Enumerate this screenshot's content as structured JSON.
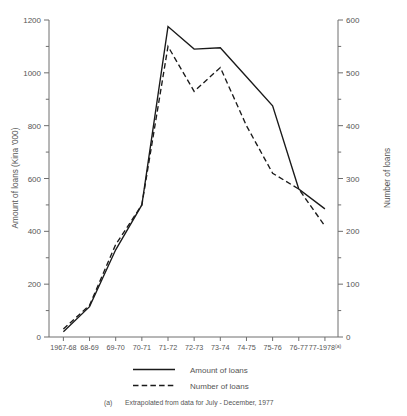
{
  "chart_data": {
    "type": "line",
    "title": "",
    "categories": [
      "1967-68",
      "68-69",
      "69-70",
      "70-71",
      "71-72",
      "72-73",
      "73-74",
      "74-75",
      "75-76",
      "76-77",
      "77-1978(a)"
    ],
    "xlabel": "",
    "ylabel": "Amount of loans (Kina '000)",
    "y2label": "Number of loans",
    "ylim": [
      0,
      1200
    ],
    "y2lim": [
      0,
      600
    ],
    "yticks": [
      0,
      200,
      400,
      600,
      800,
      1000,
      1200
    ],
    "ytick_labels": [
      "0",
      "200",
      "400",
      "600",
      "800",
      "1000",
      "1200"
    ],
    "y_minor_ticks": [
      100,
      300,
      500,
      700,
      900,
      1100
    ],
    "y2ticks": [
      0,
      100,
      200,
      300,
      400,
      500,
      600
    ],
    "y2tick_labels": [
      "0",
      "100",
      "200",
      "300",
      "400",
      "500",
      "600"
    ],
    "y2_minor_ticks": [
      50,
      150,
      250,
      350,
      450,
      550
    ],
    "grid": false,
    "legend_position": "below",
    "series": [
      {
        "name": "Amount of loans",
        "axis": "left",
        "style": "solid",
        "values": [
          20,
          115,
          330,
          500,
          1175,
          1090,
          1095,
          985,
          875,
          560,
          485
        ]
      },
      {
        "name": "Number of loans",
        "axis": "right",
        "style": "dashed",
        "values": [
          15,
          60,
          175,
          250,
          550,
          465,
          510,
          400,
          310,
          280,
          210
        ]
      }
    ],
    "annotations": [
      "(a)  Extrapolated from data for July - December, 1977"
    ]
  },
  "legend": {
    "items": [
      {
        "label": "Amount of loans",
        "style": "solid"
      },
      {
        "label": "Number of loans",
        "style": "dashed"
      }
    ]
  },
  "footnote": {
    "marker": "(a)",
    "text": "Extrapolated from data for July - December, 1977"
  },
  "axes": {
    "left_title": "Amount of loans (Kina '000)",
    "right_title": "Number of loans"
  },
  "colors": {
    "line": "#1a1a1a",
    "axis": "#6e6e6e",
    "text": "#555555",
    "background": "#ffffff"
  }
}
